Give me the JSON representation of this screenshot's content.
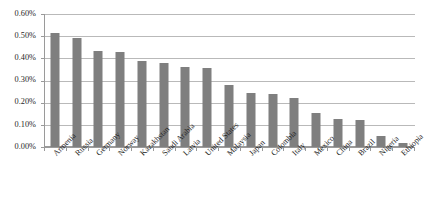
{
  "chart_data": {
    "type": "bar",
    "title": "",
    "subtitle": "",
    "xlabel": "",
    "ylabel": "",
    "ylim": [
      0,
      0.6
    ],
    "y_tick_labels": [
      "0.00%",
      "0.10%",
      "0.20%",
      "0.30%",
      "0.40%",
      "0.50%",
      "0.60%"
    ],
    "y_tick_values": [
      0,
      0.1,
      0.2,
      0.3,
      0.4,
      0.5,
      0.6
    ],
    "grid": "horizontal",
    "legend": "none",
    "value_unit": "percent",
    "bar_color": "#7f7f7f",
    "grid_color": "#b9b9b9",
    "axis_color": "#9a9a9a",
    "categories": [
      "Armenia",
      "Russia",
      "Germany",
      "Norway",
      "Kazakhstan",
      "Saudi Arabia",
      "Latvia",
      "United States",
      "Malaysia",
      "Japan",
      "Colombia",
      "Italy",
      "Mexico",
      "China",
      "Brazil",
      "Nigeria",
      "Ethiopia"
    ],
    "values": [
      0.515,
      0.49,
      0.435,
      0.43,
      0.39,
      0.38,
      0.36,
      0.355,
      0.28,
      0.245,
      0.24,
      0.22,
      0.155,
      0.125,
      0.12,
      0.05,
      0.02
    ]
  }
}
